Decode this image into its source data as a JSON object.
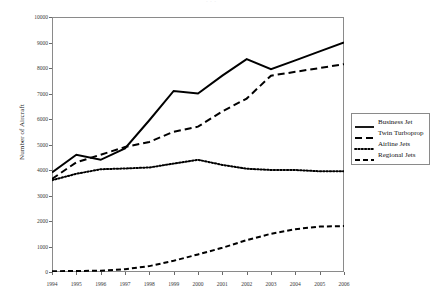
{
  "figure": {
    "title_artifact": "· · ·",
    "background_color": "#ffffff",
    "frame_color": "#8a8a8a"
  },
  "axes": {
    "y_title": "Number of Aircraft",
    "y_ticks": [
      "10000",
      "9000",
      "8000",
      "7000",
      "6000",
      "5000",
      "4000",
      "3000",
      "2000",
      "1000",
      "0"
    ],
    "x_ticks": [
      "1994",
      "1995",
      "1996",
      "1997",
      "1998",
      "1999",
      "2000",
      "2001",
      "2002",
      "2003",
      "2004",
      "2005",
      "2006"
    ]
  },
  "legend": {
    "items": [
      {
        "label": "Business Jet",
        "style": "solid",
        "color": "#000000"
      },
      {
        "label": "Twin Turboprop",
        "style": "dashed-long",
        "color": "#000000"
      },
      {
        "label": "Airline Jets",
        "style": "dotted",
        "color": "#000000"
      },
      {
        "label": "Regional Jets",
        "style": "dashed",
        "color": "#000000"
      }
    ]
  },
  "chart_data": {
    "type": "line",
    "title": "",
    "xlabel": "",
    "ylabel": "Number of Aircraft",
    "categories": [
      1994,
      1995,
      1996,
      1997,
      1998,
      1999,
      2000,
      2001,
      2002,
      2003,
      2004,
      2005,
      2006
    ],
    "xlim": [
      1994,
      2006
    ],
    "ylim": [
      0,
      10000
    ],
    "ytick_interval": 1000,
    "grid": false,
    "legend_position": "right",
    "series": [
      {
        "name": "Business Jet",
        "style": "solid",
        "color": "#000000",
        "linewidth": 2,
        "values": [
          3900,
          4600,
          4400,
          4850,
          5950,
          7100,
          7000,
          7700,
          8350,
          7950,
          8300,
          8650,
          9000
        ]
      },
      {
        "name": "Twin Turboprop",
        "style": "dashed-long",
        "color": "#000000",
        "linewidth": 2,
        "values": [
          3650,
          4300,
          4600,
          4900,
          5100,
          5500,
          5700,
          6300,
          6800,
          7700,
          7850,
          8000,
          8150
        ]
      },
      {
        "name": "Airline Jets",
        "style": "dotted",
        "color": "#000000",
        "linewidth": 2,
        "values": [
          3600,
          3850,
          4030,
          4060,
          4100,
          4250,
          4400,
          4200,
          4050,
          4000,
          4000,
          3950,
          3950
        ]
      },
      {
        "name": "Regional Jets",
        "style": "dashed",
        "color": "#000000",
        "linewidth": 2,
        "values": [
          30,
          40,
          50,
          110,
          230,
          440,
          690,
          950,
          1250,
          1500,
          1680,
          1780,
          1800
        ]
      }
    ]
  }
}
